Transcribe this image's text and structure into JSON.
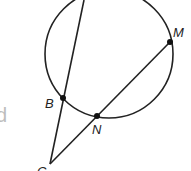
{
  "diagram": {
    "type": "circle-secant-geometry",
    "circle": {
      "cx": 109,
      "cy": 54,
      "r": 64,
      "stroke": "#222222"
    },
    "points": [
      {
        "id": "B",
        "label": "B",
        "x": 63,
        "y": 98,
        "label_x": 45,
        "label_y": 108
      },
      {
        "id": "N",
        "label": "N",
        "x": 97,
        "y": 116,
        "label_x": 92,
        "label_y": 134
      },
      {
        "id": "M",
        "label": "M",
        "x": 170,
        "y": 42,
        "label_x": 173,
        "label_y": 37
      },
      {
        "id": "C",
        "label": "C",
        "x": 50,
        "y": 164,
        "label_x": 37,
        "label_y": 176
      }
    ],
    "segments": [
      {
        "from": "C",
        "to": "top",
        "x1": 50,
        "y1": 164,
        "x2": 84,
        "y2": 0
      },
      {
        "from": "C",
        "to": "M",
        "x1": 50,
        "y1": 164,
        "x2": 170,
        "y2": 42
      }
    ],
    "left_fragment_text": "d"
  }
}
